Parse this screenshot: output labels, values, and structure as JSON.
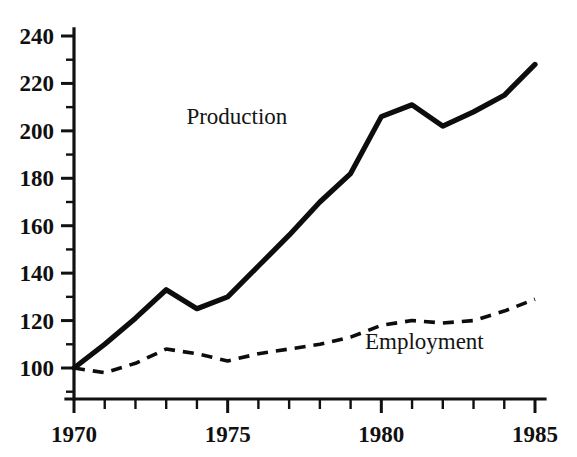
{
  "chart_data": {
    "type": "line",
    "title": "",
    "xlabel": "",
    "ylabel": "",
    "xlim": [
      1970,
      1985
    ],
    "ylim": [
      90,
      243
    ],
    "grid": false,
    "legend_position": "inline-annotation",
    "x": [
      1970,
      1971,
      1972,
      1973,
      1974,
      1975,
      1976,
      1977,
      1978,
      1979,
      1980,
      1981,
      1982,
      1983,
      1984,
      1985
    ],
    "x_tick_labels": [
      "1970",
      "1975",
      "1980",
      "1985"
    ],
    "x_tick_values": [
      1970,
      1975,
      1980,
      1985
    ],
    "x_minor_tick_values": [
      1971,
      1972,
      1973,
      1974,
      1976,
      1977,
      1978,
      1979,
      1981,
      1982,
      1983,
      1984
    ],
    "y_tick_labels": [
      "100",
      "120",
      "140",
      "160",
      "180",
      "200",
      "220",
      "240"
    ],
    "y_tick_values": [
      100,
      120,
      140,
      160,
      180,
      200,
      220,
      240
    ],
    "y_minor_tick_values": [
      90,
      110,
      130,
      150,
      170,
      190,
      210,
      230
    ],
    "series": [
      {
        "name": "Production",
        "style": "solid",
        "color": "#0d0d0d",
        "label_x": 1975.3,
        "label_y": 203,
        "values": [
          100,
          110,
          121,
          133,
          125,
          130,
          143,
          156,
          170,
          182,
          206,
          211,
          202,
          208,
          215,
          228
        ]
      },
      {
        "name": "Employment",
        "style": "dashed",
        "color": "#0d0d0d",
        "label_x": 1981.4,
        "label_y": 108,
        "values": [
          100,
          98,
          102,
          108,
          106,
          103,
          106,
          108,
          110,
          113,
          118,
          120,
          119,
          120,
          124,
          129
        ]
      }
    ]
  },
  "axes": {
    "y_axis_name": "value-axis",
    "x_axis_name": "year-axis"
  }
}
